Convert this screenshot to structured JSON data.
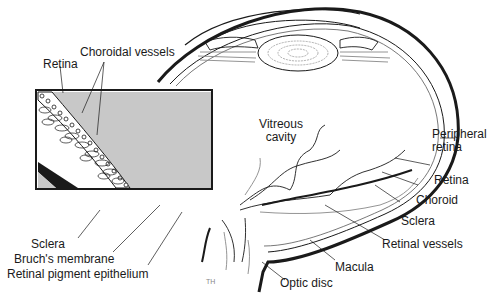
{
  "diagram": {
    "colors": {
      "ink": "#1a1a1a",
      "inset_fill": "#c8c8c8",
      "vitreous_bg": "#ffffff",
      "lens_contour": "#9a9a9a",
      "vessel_gray": "#888888"
    },
    "inset_labels": {
      "retina": "Retina",
      "choroidal_vessels": "Choroidal vessels",
      "sclera": "Sclera",
      "bruchs_membrane": "Bruch's membrane",
      "rpe": "Retinal pigment epithelium"
    },
    "eye_labels": {
      "vitreous_line1": "Vitreous",
      "vitreous_line2": "cavity",
      "peripheral_line1": "Peripheral",
      "peripheral_line2": "retina",
      "retina": "Retina",
      "choroid": "Choroid",
      "sclera": "Sclera",
      "retinal_vessels": "Retinal vessels",
      "macula": "Macula",
      "optic_disc": "Optic disc"
    },
    "artist_mark": "TH"
  }
}
